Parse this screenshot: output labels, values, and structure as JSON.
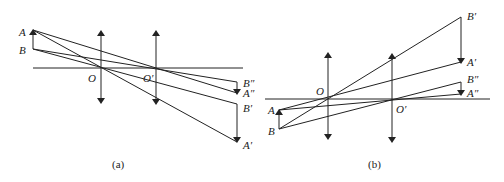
{
  "figure": {
    "panels": [
      {
        "id": "a",
        "caption": "(a)",
        "labels": {
          "A": "A",
          "B": "B",
          "O": "O",
          "O_prime": "O′",
          "B_dprime": "B″",
          "A_dprime": "A″",
          "B_prime": "B′",
          "A_prime": "A′"
        }
      },
      {
        "id": "b",
        "caption": "(b)",
        "labels": {
          "A": "A",
          "B": "B",
          "O": "O",
          "O_prime": "O′",
          "B_prime": "B′",
          "A_prime": "A′",
          "B_dprime": "B″",
          "A_dprime": "A″"
        }
      }
    ],
    "line_color": "#222222",
    "background": "#ffffff"
  }
}
